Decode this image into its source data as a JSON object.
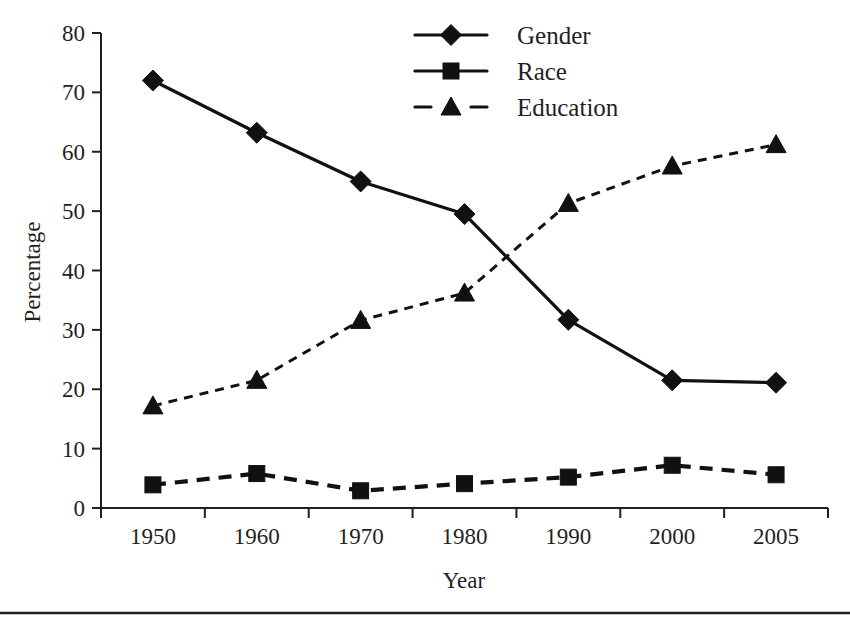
{
  "chart_data": {
    "type": "line",
    "title": "",
    "xlabel": "Year",
    "ylabel": "Percentage",
    "categories": [
      "1950",
      "1960",
      "1970",
      "1980",
      "1990",
      "2000",
      "2005"
    ],
    "ylim": [
      0,
      80
    ],
    "ytick_step": 10,
    "yticks": [
      "0",
      "10",
      "20",
      "30",
      "40",
      "50",
      "60",
      "70",
      "80"
    ],
    "grid": false,
    "legend_position": "top-center",
    "series": [
      {
        "name": "Gender",
        "marker": "diamond",
        "line_style": "solid",
        "legend_line_style": "solid",
        "values": [
          72,
          63.2,
          55,
          49.5,
          31.7,
          21.5,
          21.1
        ]
      },
      {
        "name": "Race",
        "marker": "square",
        "line_style": "dashed-long",
        "legend_line_style": "solid",
        "values": [
          3.9,
          5.8,
          2.9,
          4.1,
          5.2,
          7.2,
          5.6
        ]
      },
      {
        "name": "Education",
        "marker": "triangle",
        "line_style": "dashed-short",
        "legend_line_style": "dashed",
        "values": [
          17.2,
          21.5,
          31.6,
          36.2,
          51.3,
          57.6,
          61.2
        ]
      }
    ]
  },
  "legend": {
    "items": [
      {
        "label": "Gender"
      },
      {
        "label": "Race"
      },
      {
        "label": "Education"
      }
    ]
  },
  "axes": {
    "y_title": "Percentage",
    "x_title": "Year"
  }
}
